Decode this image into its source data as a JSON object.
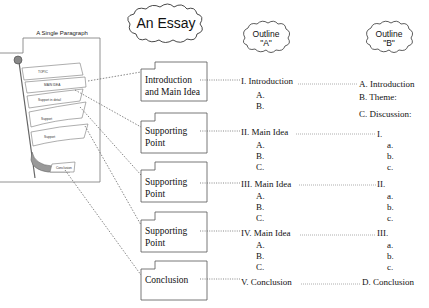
{
  "title": "An Essay",
  "paragraph_panel": {
    "title": "A Single Paragraph",
    "flags": [
      "TOPIC",
      "MAIN IDEA",
      "Support in detail",
      "Support",
      "Support",
      "Conclusion"
    ]
  },
  "outline_a_header": {
    "line1": "Outline",
    "line2": "\"A\""
  },
  "outline_b_header": {
    "line1": "Outline",
    "line2": "\"B\""
  },
  "boxes": [
    {
      "line1": "Introduction",
      "line2": "and Main Idea"
    },
    {
      "line1": "Supporting",
      "line2": "Point"
    },
    {
      "line1": "Supporting",
      "line2": "Point"
    },
    {
      "line1": "Supporting",
      "line2": "Point"
    },
    {
      "line1": "Conclusion",
      "line2": ""
    }
  ],
  "outline_a": [
    {
      "heading": "I. Introduction",
      "subs": [
        "A.",
        "B."
      ]
    },
    {
      "heading": "II. Main Idea",
      "subs": [
        "A.",
        "B.",
        "C."
      ]
    },
    {
      "heading": "III. Main Idea",
      "subs": [
        "A.",
        "B.",
        "C."
      ]
    },
    {
      "heading": "IV. Main Idea",
      "subs": [
        "A.",
        "B.",
        "C."
      ]
    },
    {
      "heading": "V. Conclusion",
      "subs": []
    }
  ],
  "outline_b": [
    {
      "heading": "A. Introduction",
      "subs": [
        "B. Theme:",
        "C. Discussion:"
      ]
    },
    {
      "heading": "I.",
      "subs": [
        "a.",
        "b.",
        "c."
      ]
    },
    {
      "heading": "II.",
      "subs": [
        "a.",
        "b.",
        "c."
      ]
    },
    {
      "heading": "III.",
      "subs": [
        "a.",
        "b.",
        "c."
      ]
    },
    {
      "heading": "D. Conclusion",
      "subs": []
    }
  ]
}
